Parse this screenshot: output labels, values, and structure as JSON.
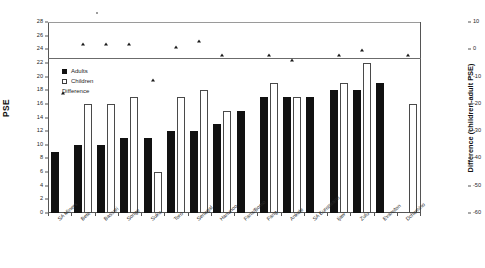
{
  "chart_data": {
    "type": "bar",
    "title": "",
    "subtitle": "",
    "xlabel": "",
    "ylabel": "PSE",
    "ylabel_secondary": "Difference (children-adult PSE)",
    "ylim": [
      0,
      28
    ],
    "ytick_step": 2,
    "yticks": [
      0,
      2,
      4,
      6,
      8,
      10,
      12,
      14,
      16,
      18,
      20,
      22,
      24,
      26,
      28
    ],
    "ylim_secondary": [
      -60,
      10
    ],
    "ytick_step_secondary": 10,
    "yticks_secondary": [
      10,
      0,
      -10,
      -20,
      -30,
      -40,
      -50,
      -60
    ],
    "grid": false,
    "legend_position": "upper-left-inside",
    "categories": [
      "SA Miners",
      "Bete",
      "Bassari",
      "Songe",
      "Suku",
      "Toro",
      "Senegal",
      "Hanunoo",
      "Fana/Bomo",
      "Fang",
      "Ankole",
      "SA Europeans",
      "Ijaw",
      "Zulu",
      "Evanston",
      "Dchomino"
    ],
    "series": [
      {
        "name": "Adults",
        "style": "filled-bar",
        "color": "#111111",
        "axis": "left",
        "values": [
          9,
          10,
          10,
          11,
          11,
          12,
          12,
          13,
          15,
          17,
          17,
          17,
          18,
          18,
          19,
          null
        ]
      },
      {
        "name": "Children",
        "style": "open-bar",
        "color": "#ffffff",
        "axis": "left",
        "values": [
          null,
          16,
          16,
          17,
          6,
          17,
          18,
          15,
          null,
          19,
          17,
          null,
          19,
          22,
          null,
          16
        ]
      },
      {
        "name": "Difference",
        "style": "triangle-marker",
        "color": "#1a1a1a",
        "axis": "right",
        "values": [
          null,
          3,
          3,
          3,
          -10,
          2,
          4,
          -1,
          null,
          -1,
          -3,
          null,
          -1,
          1,
          null,
          -1
        ]
      }
    ],
    "reference_line": {
      "label": "zero-difference",
      "left_axis_value": 22.7,
      "right_axis_value": 0
    }
  },
  "legend": {
    "items": [
      {
        "label": "Adults",
        "marker": "filled-square"
      },
      {
        "label": "Children",
        "marker": "open-square"
      },
      {
        "label": "Difference",
        "marker": "triangle"
      }
    ]
  },
  "axes": {
    "left_title": "PSE",
    "right_title": "Difference (children-adult PSE)"
  }
}
